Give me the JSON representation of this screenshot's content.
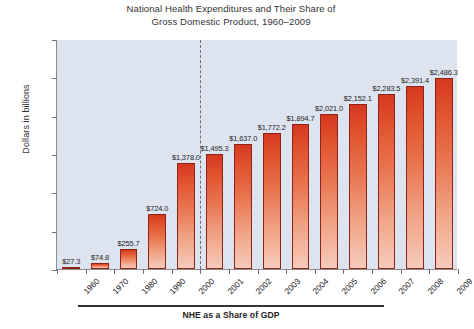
{
  "chart_data": {
    "type": "bar",
    "title": "National Health Expenditures and Their Share of Gross Domestic Product, 1960–2009",
    "title_lines": [
      "National Health Expenditures and Their Share of",
      "Gross Domestic Product, 1960–2009"
    ],
    "xlabel": "",
    "ylabel": "Dollars in billions",
    "ylim": [
      0,
      3000
    ],
    "ytick_values": [
      0,
      500,
      1000,
      1500,
      2000,
      2500,
      3000
    ],
    "ytick_labels": [
      "$0",
      "$500",
      "$1,000",
      "$1,500",
      "$2,000",
      "$2,500",
      "$3,000"
    ],
    "grid": false,
    "legend": "none",
    "categories": [
      "1960",
      "1970",
      "1980",
      "1990",
      "2000",
      "2001",
      "2002",
      "2003",
      "2004",
      "2005",
      "2006",
      "2007",
      "2008",
      "2009"
    ],
    "values": [
      27.3,
      74.8,
      255.7,
      724.0,
      1378.0,
      1495.3,
      1637.0,
      1772.2,
      1894.7,
      2021.0,
      2152.1,
      2283.5,
      2391.4,
      2486.3
    ],
    "value_labels": [
      "$27.3",
      "$74.8",
      "$255.7",
      "$724.0",
      "$1,378.0",
      "$1,495.3",
      "$1,637.0",
      "$1,772.2",
      "$1,894.7",
      "$2,021.0",
      "$2,152.1",
      "$2,283.5",
      "$2,391.4",
      "$2,486.3"
    ],
    "annotations": [
      {
        "name": "period-divider",
        "type": "vertical-dashed-line",
        "between": [
          "2000",
          "2001"
        ]
      }
    ],
    "colors": {
      "bar_top": "#d6381f",
      "bar_bottom": "#f7cbbb",
      "bar_outline": "#8e2415",
      "plot_background": "#dde4ef",
      "axis": "#8d8d8d",
      "divider": "#6d6d6d",
      "text": "#222222"
    }
  },
  "footer": {
    "caption": "NHE as a Share of GDP"
  }
}
